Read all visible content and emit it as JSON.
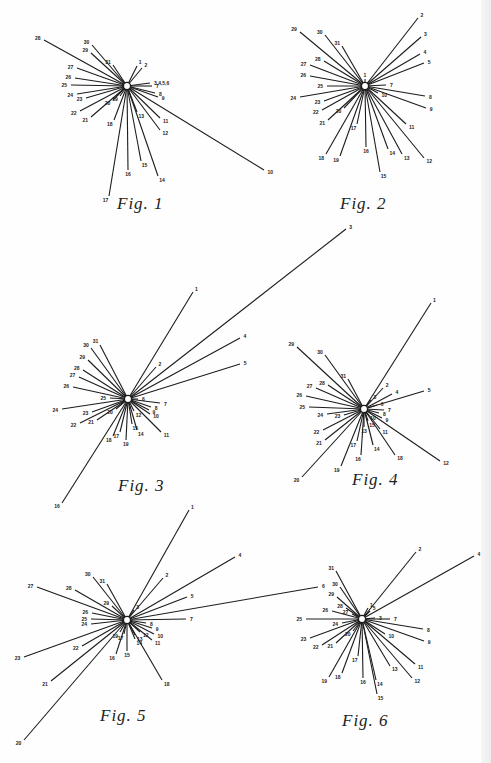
{
  "page": {
    "background": "#fefefe",
    "ink": "#1c1c1c"
  },
  "figures": [
    {
      "id": "fig1",
      "caption": "Fig. 1",
      "caption_pos": [
        117,
        210
      ],
      "center": [
        127,
        86
      ],
      "spokes": [
        {
          "label": "1",
          "x": 137,
          "y": 66
        },
        {
          "label": "2",
          "x": 142,
          "y": 68
        },
        {
          "label": "3,4,5,6",
          "x": 150,
          "y": 83
        },
        {
          "label": "7",
          "x": 152,
          "y": 86
        },
        {
          "label": "8",
          "x": 155,
          "y": 93
        },
        {
          "label": "9",
          "x": 158,
          "y": 97
        },
        {
          "label": "10",
          "x": 264,
          "y": 170
        },
        {
          "label": "11",
          "x": 160,
          "y": 118
        },
        {
          "label": "12",
          "x": 160,
          "y": 130
        },
        {
          "label": "13",
          "x": 137,
          "y": 112
        },
        {
          "label": "14",
          "x": 158,
          "y": 176
        },
        {
          "label": "15",
          "x": 141,
          "y": 161
        },
        {
          "label": "16",
          "x": 128,
          "y": 170
        },
        {
          "label": "17",
          "x": 109,
          "y": 196
        },
        {
          "label": "18",
          "x": 114,
          "y": 120
        },
        {
          "label": "19",
          "x": 120,
          "y": 96
        },
        {
          "label": "20",
          "x": 113,
          "y": 100
        },
        {
          "label": "21",
          "x": 91,
          "y": 117
        },
        {
          "label": "22",
          "x": 80,
          "y": 111
        },
        {
          "label": "23",
          "x": 86,
          "y": 98
        },
        {
          "label": "24",
          "x": 77,
          "y": 94
        },
        {
          "label": "25",
          "x": 71,
          "y": 85
        },
        {
          "label": "26",
          "x": 75,
          "y": 78
        },
        {
          "label": "27",
          "x": 77,
          "y": 68
        },
        {
          "label": "28",
          "x": 44,
          "y": 40
        },
        {
          "label": "29",
          "x": 91,
          "y": 53
        },
        {
          "label": "30",
          "x": 92,
          "y": 45
        },
        {
          "label": "31",
          "x": 113,
          "y": 65
        }
      ]
    },
    {
      "id": "fig2",
      "caption": "Fig. 2",
      "caption_pos": [
        340,
        210
      ],
      "center": [
        365,
        86
      ],
      "spokes": [
        {
          "label": "1",
          "x": 365,
          "y": 79
        },
        {
          "label": "2",
          "x": 418,
          "y": 18
        },
        {
          "label": "3",
          "x": 421,
          "y": 37
        },
        {
          "label": "4",
          "x": 420,
          "y": 54
        },
        {
          "label": "5",
          "x": 424,
          "y": 63
        },
        {
          "label": "7",
          "x": 386,
          "y": 85
        },
        {
          "label": "8",
          "x": 425,
          "y": 96
        },
        {
          "label": "9",
          "x": 426,
          "y": 108
        },
        {
          "label": "10",
          "x": 378,
          "y": 93
        },
        {
          "label": "11",
          "x": 406,
          "y": 124
        },
        {
          "label": "12",
          "x": 424,
          "y": 158
        },
        {
          "label": "13",
          "x": 402,
          "y": 154
        },
        {
          "label": "14",
          "x": 388,
          "y": 149
        },
        {
          "label": "15",
          "x": 380,
          "y": 172
        },
        {
          "label": "16",
          "x": 366,
          "y": 147
        },
        {
          "label": "17",
          "x": 357,
          "y": 124
        },
        {
          "label": "18",
          "x": 326,
          "y": 154
        },
        {
          "label": "19",
          "x": 340,
          "y": 156
        },
        {
          "label": "20",
          "x": 344,
          "y": 108
        },
        {
          "label": "21",
          "x": 328,
          "y": 120
        },
        {
          "label": "22",
          "x": 322,
          "y": 110
        },
        {
          "label": "23",
          "x": 324,
          "y": 101
        },
        {
          "label": "24",
          "x": 300,
          "y": 97
        },
        {
          "label": "25",
          "x": 327,
          "y": 86
        },
        {
          "label": "26",
          "x": 310,
          "y": 76
        },
        {
          "label": "27",
          "x": 310,
          "y": 65
        },
        {
          "label": "28",
          "x": 324,
          "y": 61
        },
        {
          "label": "29",
          "x": 300,
          "y": 32
        },
        {
          "label": "30",
          "x": 325,
          "y": 35
        },
        {
          "label": "31",
          "x": 342,
          "y": 46
        }
      ]
    },
    {
      "id": "fig3",
      "caption": "Fig. 3",
      "caption_pos": [
        118,
        492
      ],
      "center": [
        128,
        399
      ],
      "spokes": [
        {
          "label": "1",
          "x": 193,
          "y": 292
        },
        {
          "label": "2",
          "x": 156,
          "y": 367
        },
        {
          "label": "3",
          "x": 346,
          "y": 229
        },
        {
          "label": "4",
          "x": 240,
          "y": 338
        },
        {
          "label": "5",
          "x": 240,
          "y": 364
        },
        {
          "label": "6",
          "x": 138,
          "y": 399
        },
        {
          "label": "7",
          "x": 160,
          "y": 403
        },
        {
          "label": "8",
          "x": 151,
          "y": 407
        },
        {
          "label": "9",
          "x": 149,
          "y": 410
        },
        {
          "label": "10",
          "x": 150,
          "y": 414
        },
        {
          "label": "11",
          "x": 161,
          "y": 432
        },
        {
          "label": "12",
          "x": 134,
          "y": 411
        },
        {
          "label": "14",
          "x": 137,
          "y": 430
        },
        {
          "label": "15",
          "x": 132,
          "y": 424
        },
        {
          "label": "16",
          "x": 62,
          "y": 503
        },
        {
          "label": "17",
          "x": 120,
          "y": 432
        },
        {
          "label": "18",
          "x": 113,
          "y": 436
        },
        {
          "label": "19",
          "x": 126,
          "y": 440
        },
        {
          "label": "20",
          "x": 116,
          "y": 409
        },
        {
          "label": "21",
          "x": 97,
          "y": 420
        },
        {
          "label": "22",
          "x": 80,
          "y": 423
        },
        {
          "label": "23",
          "x": 92,
          "y": 412
        },
        {
          "label": "24",
          "x": 62,
          "y": 409
        },
        {
          "label": "25",
          "x": 110,
          "y": 398
        },
        {
          "label": "26",
          "x": 73,
          "y": 387
        },
        {
          "label": "27",
          "x": 79,
          "y": 377
        },
        {
          "label": "28",
          "x": 83,
          "y": 370
        },
        {
          "label": "29",
          "x": 88,
          "y": 360
        },
        {
          "label": "30",
          "x": 91,
          "y": 348
        },
        {
          "label": "31",
          "x": 100,
          "y": 345
        }
      ]
    },
    {
      "id": "fig4",
      "caption": "Fig. 4",
      "caption_pos": [
        352,
        486
      ],
      "center": [
        364,
        409
      ],
      "spokes": [
        {
          "label": "1",
          "x": 431,
          "y": 303
        },
        {
          "label": "2",
          "x": 383,
          "y": 388
        },
        {
          "label": "3",
          "x": 371,
          "y": 400
        },
        {
          "label": "4",
          "x": 392,
          "y": 394
        },
        {
          "label": "5",
          "x": 424,
          "y": 391
        },
        {
          "label": "6",
          "x": 377,
          "y": 405
        },
        {
          "label": "7",
          "x": 384,
          "y": 410
        },
        {
          "label": "8",
          "x": 379,
          "y": 413
        },
        {
          "label": "9",
          "x": 382,
          "y": 418
        },
        {
          "label": "10",
          "x": 368,
          "y": 415
        },
        {
          "label": "11",
          "x": 380,
          "y": 429
        },
        {
          "label": "12",
          "x": 440,
          "y": 461
        },
        {
          "label": "13",
          "x": 364,
          "y": 427
        },
        {
          "label": "14",
          "x": 373,
          "y": 445
        },
        {
          "label": "15",
          "x": 368,
          "y": 421
        },
        {
          "label": "16",
          "x": 361,
          "y": 455
        },
        {
          "label": "17",
          "x": 357,
          "y": 441
        },
        {
          "label": "18",
          "x": 395,
          "y": 455
        },
        {
          "label": "19",
          "x": 341,
          "y": 466
        },
        {
          "label": "20",
          "x": 302,
          "y": 477
        },
        {
          "label": "21",
          "x": 325,
          "y": 440
        },
        {
          "label": "22",
          "x": 323,
          "y": 430
        },
        {
          "label": "23",
          "x": 344,
          "y": 415
        },
        {
          "label": "24",
          "x": 327,
          "y": 414
        },
        {
          "label": "25",
          "x": 309,
          "y": 407
        },
        {
          "label": "26",
          "x": 306,
          "y": 396
        },
        {
          "label": "27",
          "x": 316,
          "y": 388
        },
        {
          "label": "28",
          "x": 328,
          "y": 385
        },
        {
          "label": "29",
          "x": 297,
          "y": 347
        },
        {
          "label": "30",
          "x": 325,
          "y": 355
        },
        {
          "label": "31",
          "x": 348,
          "y": 379
        }
      ]
    },
    {
      "id": "fig5",
      "caption": "Fig. 5",
      "caption_pos": [
        100,
        722
      ],
      "center": [
        127,
        620
      ],
      "spokes": [
        {
          "label": "1",
          "x": 189,
          "y": 510
        },
        {
          "label": "2",
          "x": 163,
          "y": 578
        },
        {
          "label": "3",
          "x": 134,
          "y": 610
        },
        {
          "label": "4",
          "x": 235,
          "y": 557
        },
        {
          "label": "5",
          "x": 187,
          "y": 597
        },
        {
          "label": "6",
          "x": 318,
          "y": 587
        },
        {
          "label": "7",
          "x": 186,
          "y": 619
        },
        {
          "label": "8",
          "x": 146,
          "y": 623
        },
        {
          "label": "9",
          "x": 152,
          "y": 628
        },
        {
          "label": "10",
          "x": 154,
          "y": 634
        },
        {
          "label": "11",
          "x": 152,
          "y": 640
        },
        {
          "label": "12",
          "x": 140,
          "y": 632
        },
        {
          "label": "13",
          "x": 135,
          "y": 635
        },
        {
          "label": "14",
          "x": 135,
          "y": 639
        },
        {
          "label": "15",
          "x": 127,
          "y": 651
        },
        {
          "label": "16",
          "x": 116,
          "y": 654
        },
        {
          "label": "17",
          "x": 124,
          "y": 634
        },
        {
          "label": "18",
          "x": 162,
          "y": 680
        },
        {
          "label": "19",
          "x": 120,
          "y": 632
        },
        {
          "label": "20",
          "x": 24,
          "y": 740
        },
        {
          "label": "21",
          "x": 51,
          "y": 681
        },
        {
          "label": "22",
          "x": 82,
          "y": 646
        },
        {
          "label": "23",
          "x": 24,
          "y": 657
        },
        {
          "label": "24",
          "x": 91,
          "y": 624
        },
        {
          "label": "25",
          "x": 91,
          "y": 619
        },
        {
          "label": "26",
          "x": 92,
          "y": 613
        },
        {
          "label": "27",
          "x": 37,
          "y": 587
        },
        {
          "label": "28",
          "x": 75,
          "y": 590
        },
        {
          "label": "29",
          "x": 112,
          "y": 606
        },
        {
          "label": "30",
          "x": 93,
          "y": 577
        },
        {
          "label": "31",
          "x": 107,
          "y": 584
        }
      ]
    },
    {
      "id": "fig6",
      "caption": "Fig. 6",
      "caption_pos": [
        342,
        727
      ],
      "center": [
        362,
        619
      ],
      "spokes": [
        {
          "label": "1",
          "x": 368,
          "y": 608
        },
        {
          "label": "2",
          "x": 416,
          "y": 552
        },
        {
          "label": "3",
          "x": 375,
          "y": 618
        },
        {
          "label": "4",
          "x": 474,
          "y": 556
        },
        {
          "label": "5",
          "x": 370,
          "y": 611
        },
        {
          "label": "7",
          "x": 390,
          "y": 619
        },
        {
          "label": "8",
          "x": 423,
          "y": 629
        },
        {
          "label": "9",
          "x": 424,
          "y": 641
        },
        {
          "label": "10",
          "x": 385,
          "y": 634
        },
        {
          "label": "11",
          "x": 415,
          "y": 664
        },
        {
          "label": "12",
          "x": 412,
          "y": 678
        },
        {
          "label": "13",
          "x": 390,
          "y": 666
        },
        {
          "label": "14",
          "x": 376,
          "y": 680
        },
        {
          "label": "15",
          "x": 377,
          "y": 694
        },
        {
          "label": "16",
          "x": 363,
          "y": 678
        },
        {
          "label": "17",
          "x": 358,
          "y": 656
        },
        {
          "label": "18",
          "x": 342,
          "y": 673
        },
        {
          "label": "19",
          "x": 329,
          "y": 677
        },
        {
          "label": "20",
          "x": 353,
          "y": 631
        },
        {
          "label": "21",
          "x": 336,
          "y": 643
        },
        {
          "label": "22",
          "x": 322,
          "y": 645
        },
        {
          "label": "23",
          "x": 310,
          "y": 638
        },
        {
          "label": "24",
          "x": 342,
          "y": 623
        },
        {
          "label": "25",
          "x": 306,
          "y": 619
        },
        {
          "label": "26",
          "x": 332,
          "y": 611
        },
        {
          "label": "27",
          "x": 352,
          "y": 614
        },
        {
          "label": "28",
          "x": 346,
          "y": 608
        },
        {
          "label": "29",
          "x": 337,
          "y": 597
        },
        {
          "label": "30",
          "x": 340,
          "y": 587
        },
        {
          "label": "31",
          "x": 336,
          "y": 571
        }
      ]
    }
  ]
}
